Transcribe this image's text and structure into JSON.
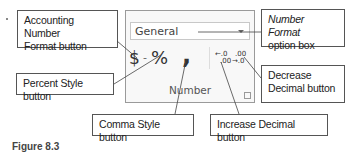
{
  "callouts": {
    "accounting": "Accounting Number Format button",
    "accounting_line1": "Accounting Number",
    "accounting_line2": "Format button",
    "number_format_line1": "Number Format",
    "number_format_line2": "option box",
    "percent": "Percent Style button",
    "decrease_line1": "Decrease",
    "decrease_line2": "Decimal button",
    "comma": "Comma Style button",
    "increase": "Increase Decimal button"
  },
  "ribbon": {
    "number_format_value": "General",
    "accounting_glyph": "$",
    "dropdown_glyph": "-",
    "percent_glyph": "%",
    "comma_glyph": ",",
    "increase_decimal_top": "←.0",
    "increase_decimal_bottom": ".00",
    "decrease_decimal_top": ".00",
    "decrease_decimal_bottom": "→.0",
    "group_label": "Number"
  },
  "caption": "Figure 8.3"
}
